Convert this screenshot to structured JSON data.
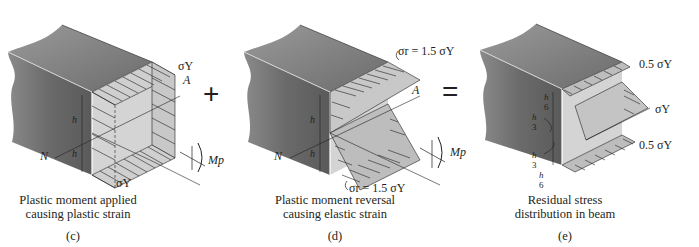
{
  "figures": [
    {
      "id": "c",
      "label": "(c)",
      "caption_line1": "Plastic moment applied",
      "caption_line2": "causing plastic strain",
      "annotations": {
        "top_stress": "σY",
        "bottom_stress": "σY",
        "point_a": "A",
        "point_n": "N",
        "moment": "Mp",
        "h_half_top": "h/2",
        "h_half_bottom": "h/2"
      }
    },
    {
      "id": "d",
      "label": "(d)",
      "caption_line1": "Plastic moment reversal",
      "caption_line2": "causing elastic strain",
      "annotations": {
        "top_stress": "σr = 1.5 σY",
        "bottom_stress": "σr = 1.5 σY",
        "point_a": "A",
        "point_n": "N",
        "moment": "Mp",
        "h_half_top": "h/2",
        "h_half_bottom": "h/2"
      }
    },
    {
      "id": "e",
      "label": "(e)",
      "caption_line1": "Residual stress",
      "caption_line2": "distribution in beam",
      "annotations": {
        "top_stress": "0.5 σY",
        "mid_stress": "σY",
        "bottom_stress": "0.5 σY",
        "dims": [
          "h/6",
          "h/3",
          "h/3",
          "h/6"
        ]
      }
    }
  ],
  "operators": {
    "plus": "+",
    "equals": "="
  },
  "colors": {
    "beam_top": "#7d7d7d",
    "beam_side": "#6a6a6a",
    "stress_fill": "#cfcfcf",
    "line": "#231f20"
  }
}
